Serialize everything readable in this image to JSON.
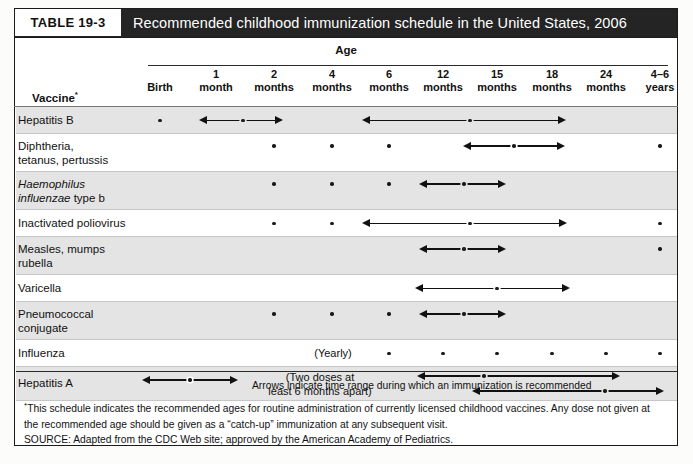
{
  "table": {
    "number_label": "TABLE 19-3",
    "title": "Recommended childhood immunization schedule in the United States, 2006",
    "age_group_header": "Age",
    "vaccine_header": "Vaccine",
    "vaccine_header_marker": "*"
  },
  "columns": [
    {
      "id": "birth",
      "line1": "",
      "line2": "Birth",
      "x": 160
    },
    {
      "id": "m1",
      "line1": "1",
      "line2": "month",
      "x": 216
    },
    {
      "id": "m2",
      "line1": "2",
      "line2": "months",
      "x": 274
    },
    {
      "id": "m4",
      "line1": "4",
      "line2": "months",
      "x": 332
    },
    {
      "id": "m6",
      "line1": "6",
      "line2": "months",
      "x": 389
    },
    {
      "id": "m12",
      "line1": "12",
      "line2": "months",
      "x": 443
    },
    {
      "id": "m15",
      "line1": "15",
      "line2": "months",
      "x": 497
    },
    {
      "id": "m18",
      "line1": "18",
      "line2": "months",
      "x": 552
    },
    {
      "id": "m24",
      "line1": "24",
      "line2": "months",
      "x": 606
    },
    {
      "id": "y4_6",
      "line1": "4–6",
      "line2": "years",
      "x": 660
    }
  ],
  "rows": [
    {
      "id": "hepatitis-b",
      "label": "Hepatitis B",
      "label_html": "Hepatitis B",
      "shade": true,
      "height": 27,
      "dots": [
        "birth"
      ],
      "arrows": [
        {
          "from": "m1",
          "to": "m2",
          "dot_at": "m2",
          "from_px": 199,
          "to_px": 283,
          "dot_px": 243
        },
        {
          "from": "m6",
          "to": "m18",
          "dot_at": "m15",
          "from_px": 362,
          "to_px": 566,
          "dot_px": 470
        }
      ],
      "notes": []
    },
    {
      "id": "diphtheria-tetanus-pertussis",
      "label": "Diphtheria, tetanus, pertussis",
      "label_html": "Diphtheria,<br>tetanus, pertussis",
      "shade": false,
      "height": 38,
      "dots": [
        "m2",
        "m4",
        "m6",
        "y4_6"
      ],
      "arrows": [
        {
          "from": "m12",
          "to": "m18",
          "dot_at": "m15",
          "from_px": 463,
          "to_px": 565,
          "dot_px": 514
        }
      ],
      "notes": []
    },
    {
      "id": "haemophilus-influenzae-type-b",
      "label": "Haemophilus influenzae type b",
      "label_html": "<span class=\"it\">Haemophilus</span><br><span class=\"it\">influenzae</span> type b",
      "shade": true,
      "height": 38,
      "dots": [
        "m2",
        "m4",
        "m6"
      ],
      "arrows": [
        {
          "from": "m12",
          "to": "m15",
          "dot_at": "m12",
          "from_px": 419,
          "to_px": 506,
          "dot_px": 464
        }
      ],
      "notes": []
    },
    {
      "id": "inactivated-poliovirus",
      "label": "Inactivated poliovirus",
      "label_html": "Inactivated poliovirus",
      "shade": false,
      "height": 27,
      "dots": [
        "m2",
        "m4",
        "y4_6"
      ],
      "arrows": [
        {
          "from": "m6",
          "to": "m18",
          "dot_at": "m15",
          "from_px": 362,
          "to_px": 567,
          "dot_px": 470
        }
      ],
      "notes": []
    },
    {
      "id": "measles-mumps-rubella",
      "label": "Measles, mumps rubella",
      "label_html": "Measles, mumps<br>rubella",
      "shade": true,
      "height": 38,
      "dots": [
        "y4_6"
      ],
      "arrows": [
        {
          "from": "m12",
          "to": "m15",
          "dot_at": "m12",
          "from_px": 419,
          "to_px": 506,
          "dot_px": 464
        }
      ],
      "notes": []
    },
    {
      "id": "varicella",
      "label": "Varicella",
      "label_html": "Varicella",
      "shade": false,
      "height": 27,
      "dots": [],
      "arrows": [
        {
          "from": "m12",
          "to": "m18",
          "dot_at": "m15",
          "from_px": 415,
          "to_px": 570,
          "dot_px": 497
        }
      ],
      "notes": []
    },
    {
      "id": "pneumococcal-conjugate",
      "label": "Pneumococcal conjugate",
      "label_html": "Pneumococcal<br>conjugate",
      "shade": true,
      "height": 38,
      "dots": [
        "m2",
        "m4",
        "m6"
      ],
      "arrows": [
        {
          "from": "m12",
          "to": "m15",
          "dot_at": "m12",
          "from_px": 419,
          "to_px": 506,
          "dot_px": 464
        }
      ],
      "notes": []
    },
    {
      "id": "influenza",
      "label": "Influenza",
      "label_html": "Influenza",
      "shade": false,
      "height": 27,
      "dots": [
        "m6",
        "m12",
        "m15",
        "m18",
        "m24",
        "y4_6"
      ],
      "arrows": [],
      "notes": [
        {
          "text": "(Yearly)",
          "x": 333
        }
      ]
    },
    {
      "id": "hepatitis-a",
      "label": "Hepatitis A",
      "label_html": "Hepatitis A",
      "shade": true,
      "height": 34,
      "dots": [],
      "arrows": [
        {
          "from": "m12",
          "to": "m18",
          "dot_at": "m15",
          "from_px": 417,
          "to_px": 620,
          "dot_px": 484,
          "y": 9
        },
        {
          "from": "m15",
          "to": "y4_6",
          "dot_at": "m18",
          "from_px": 472,
          "to_px": 664,
          "dot_px": 605,
          "y": 24
        }
      ],
      "notes": [
        {
          "text": "(Two doses at\nleast 6 months apart)",
          "x": 320
        }
      ]
    }
  ],
  "legend": {
    "arrow_text": "Arrows indicate time range during which an immunization is recommended"
  },
  "footnotes": {
    "marker": "*",
    "text": "This schedule indicates the recommended ages for routine administration of currently licensed childhood vaccines. Any dose not given at the recommended age should be given as a “catch-up” immunization at any subsequent visit.",
    "source": "SOURCE: Adapted from the CDC Web site; approved by the American Academy of Pediatrics."
  },
  "colors": {
    "title_bar": "#242424",
    "shade_row": "#e4e4e4",
    "mark": "#1a1a1a",
    "border": "#1b1b1b"
  }
}
